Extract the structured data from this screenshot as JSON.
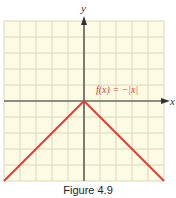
{
  "chart_data": {
    "type": "line",
    "title": "",
    "function_label": "f(x) = −|x|",
    "xlabel": "x",
    "ylabel": "y",
    "xlim": [
      -5,
      5
    ],
    "ylim": [
      -5,
      5
    ],
    "grid": true,
    "series": [
      {
        "name": "f(x) = −|x|",
        "x": [
          -5,
          0,
          5
        ],
        "y": [
          -5,
          0,
          -5
        ],
        "color": "#e0413a"
      }
    ]
  },
  "labels": {
    "x_axis": "x",
    "y_axis": "y",
    "function": "f(x) = −|x|",
    "caption": "Figure 4.9"
  },
  "colors": {
    "grid_background": "#fdfbe3",
    "grid_line": "#d9d6bd",
    "axis": "#333333",
    "curve": "#e0413a"
  }
}
